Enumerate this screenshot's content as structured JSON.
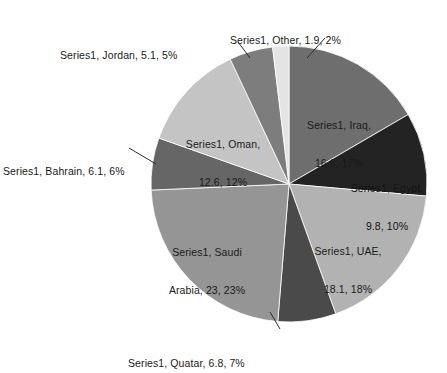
{
  "chart_data": {
    "type": "pie",
    "title": "",
    "series_name": "Series1",
    "legend_position": "none",
    "grid": false,
    "total": 100.0,
    "categories": [
      "Iraq",
      "Egypt",
      "UAE",
      "Quatar",
      "Saudi Arabia",
      "Bahrain",
      "Oman",
      "Jordan",
      "Other"
    ],
    "values": [
      16.6,
      9.8,
      18.1,
      6.8,
      23,
      6.1,
      12.6,
      5.1,
      1.9
    ],
    "percentages": [
      17,
      10,
      18,
      7,
      23,
      6,
      12,
      5,
      2
    ],
    "colors": [
      "#6e6e6e",
      "#232323",
      "#b2b2b2",
      "#4a4a4a",
      "#959595",
      "#666666",
      "#c4c4c4",
      "#7d7d7d",
      "#e4e4e4"
    ],
    "slices": [
      {
        "name": "Iraq",
        "value": 16.6,
        "percent": 17,
        "color": "#6e6e6e",
        "label": "Series1, Iraq,\n16.6, 17%",
        "label_line1": "Series1, Iraq,",
        "label_line2": "16.6, 17%",
        "label_placement": "inside"
      },
      {
        "name": "Egypt",
        "value": 9.8,
        "percent": 10,
        "color": "#232323",
        "label": "Series1, Egypt,\n9.8, 10%",
        "label_line1": "Series1, Egypt,",
        "label_line2": "9.8, 10%",
        "label_placement": "inside"
      },
      {
        "name": "UAE",
        "value": 18.1,
        "percent": 18,
        "color": "#b2b2b2",
        "label": "Series1, UAE,\n18.1, 18%",
        "label_line1": "Series1, UAE,",
        "label_line2": "18.1, 18%",
        "label_placement": "inside"
      },
      {
        "name": "Quatar",
        "value": 6.8,
        "percent": 7,
        "color": "#4a4a4a",
        "label": "Series1, Quatar, 6.8, 7%",
        "label_line1": "Series1, Quatar, 6.8, 7%",
        "label_line2": "",
        "label_placement": "outside"
      },
      {
        "name": "Saudi Arabia",
        "value": 23,
        "percent": 23,
        "color": "#959595",
        "label": "Series1, Saudi\nArabia, 23, 23%",
        "label_line1": "Series1, Saudi",
        "label_line2": "Arabia, 23, 23%",
        "label_placement": "inside"
      },
      {
        "name": "Bahrain",
        "value": 6.1,
        "percent": 6,
        "color": "#666666",
        "label": "Series1, Bahrain, 6.1, 6%",
        "label_line1": "Series1, Bahrain, 6.1, 6%",
        "label_line2": "",
        "label_placement": "outside"
      },
      {
        "name": "Oman",
        "value": 12.6,
        "percent": 12,
        "color": "#c4c4c4",
        "label": "Series1, Oman,\n12.6, 12%",
        "label_line1": "Series1, Oman,",
        "label_line2": "12.6, 12%",
        "label_placement": "inside"
      },
      {
        "name": "Jordan",
        "value": 5.1,
        "percent": 5,
        "color": "#7d7d7d",
        "label": "Series1, Jordan, 5.1, 5%",
        "label_line1": "Series1, Jordan, 5.1, 5%",
        "label_line2": "",
        "label_placement": "outside"
      },
      {
        "name": "Other",
        "value": 1.9,
        "percent": 2,
        "color": "#e4e4e4",
        "label": "Series1, Other, 1.9, 2%",
        "label_line1": "Series1, Other, 1.9, 2%",
        "label_line2": "",
        "label_placement": "outside"
      }
    ]
  },
  "geometry": {
    "center_x": 289,
    "center_y": 184,
    "radius": 138,
    "start_angle_deg": 0
  }
}
